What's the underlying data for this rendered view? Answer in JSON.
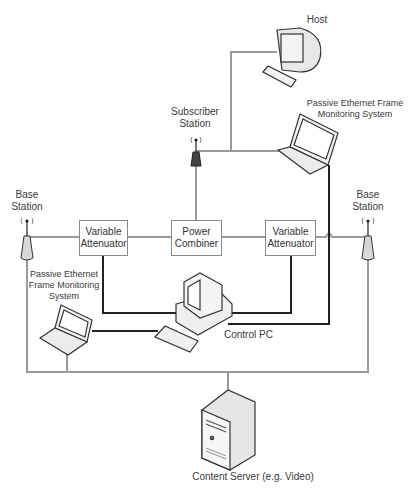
{
  "diagram": {
    "type": "network-topology",
    "nodes": {
      "host": {
        "label": "Host"
      },
      "subscriber_station": {
        "label_line1": "Subscriber",
        "label_line2": "Station"
      },
      "monitor_top": {
        "label_line1": "Passive Ethernet Frame",
        "label_line2": "Monitoring System"
      },
      "base_station_left": {
        "label_line1": "Base",
        "label_line2": "Station"
      },
      "base_station_right": {
        "label_line1": "Base",
        "label_line2": "Station"
      },
      "attenuator_left": {
        "label_line1": "Variable",
        "label_line2": "Attenuator"
      },
      "power_combiner": {
        "label_line1": "Power",
        "label_line2": "Combiner"
      },
      "attenuator_right": {
        "label_line1": "Variable",
        "label_line2": "Attenuator"
      },
      "monitor_bottom": {
        "label_line1": "Passive Ethernet",
        "label_line2": "Frame Monitoring",
        "label_line3": "System"
      },
      "control_pc": {
        "label": "Control PC"
      },
      "content_server": {
        "label": "Content Server (e.g. Video)"
      }
    },
    "edges": [
      {
        "from": "host",
        "to": "subscriber_station",
        "style": "gray"
      },
      {
        "from": "subscriber_station",
        "to": "monitor_top",
        "style": "gray"
      },
      {
        "from": "subscriber_station",
        "to": "power_combiner",
        "style": "gray"
      },
      {
        "from": "base_station_left",
        "to": "attenuator_left",
        "style": "gray"
      },
      {
        "from": "attenuator_left",
        "to": "power_combiner",
        "style": "gray"
      },
      {
        "from": "power_combiner",
        "to": "attenuator_right",
        "style": "gray"
      },
      {
        "from": "attenuator_right",
        "to": "base_station_right",
        "style": "gray"
      },
      {
        "from": "attenuator_left",
        "to": "control_pc",
        "style": "black"
      },
      {
        "from": "attenuator_right",
        "to": "control_pc",
        "style": "black"
      },
      {
        "from": "monitor_top",
        "to": "control_pc",
        "style": "black"
      },
      {
        "from": "monitor_bottom",
        "to": "control_pc",
        "style": "black"
      },
      {
        "from": "base_station_left",
        "to": "content_server",
        "style": "gray"
      },
      {
        "from": "base_station_right",
        "to": "content_server",
        "style": "gray"
      },
      {
        "from": "monitor_bottom",
        "to": "content_server",
        "style": "gray"
      }
    ],
    "colors": {
      "gray_link": "#9a9a9a",
      "black_link": "#222222",
      "subscriber_antenna": "#444444",
      "base_antenna": "#d8d8d8"
    }
  }
}
